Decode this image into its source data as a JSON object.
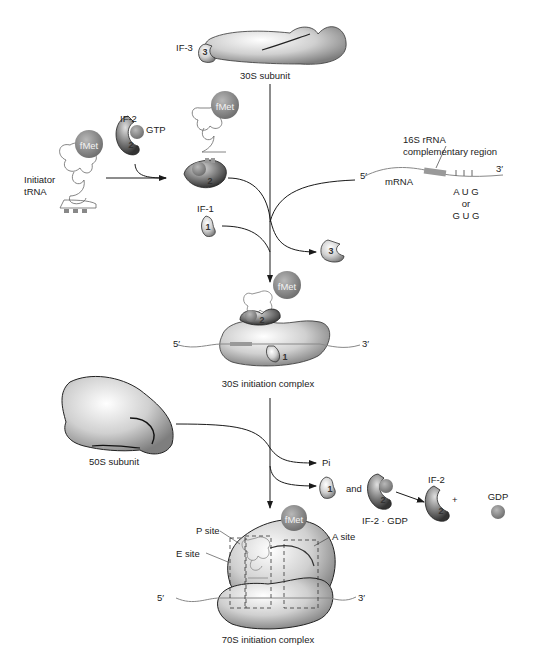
{
  "diagram": {
    "colors": {
      "ribosome_light": "#f2f2f2",
      "ribosome_dark": "#8a8a8a",
      "fmet_ball": "#8e8e8e",
      "line": "#1a1a1a",
      "mrna": "#777777",
      "complementary_region": "#9a9a9a"
    },
    "stage1": {
      "if3_label": "IF-3",
      "if3_number": "3",
      "subunit_label": "30S subunit"
    },
    "stage2": {
      "initiator_label_line1": "Initiator",
      "initiator_label_line2": "tRNA",
      "fmet_label": "fMet",
      "if2_label": "IF-2",
      "gtp_label": "GTP",
      "if2_number": "2",
      "if1_label": "IF-1",
      "if1_number": "1"
    },
    "mrna": {
      "five_prime": "5′",
      "three_prime": "3′",
      "label": "mRNA",
      "complementary_line1": "16S rRNA",
      "complementary_line2": "complementary region",
      "codon1": "A U G",
      "or": "or",
      "codon2": "G U G"
    },
    "released_if3": {
      "number": "3"
    },
    "complex30S": {
      "fmet_label": "fMet",
      "five_prime": "5′",
      "three_prime": "3′",
      "if2_number": "2",
      "if1_number": "1",
      "label": "30S initiation complex"
    },
    "subunit50S": {
      "label": "50S subunit"
    },
    "products": {
      "pi_label": "Pi",
      "if1_number": "1",
      "and_label": "and",
      "if2gdp_number": "2",
      "if2gdp_label": "IF-2 · GDP",
      "if2_label": "IF-2",
      "if2_number": "2",
      "plus": "+",
      "gdp_label": "GDP"
    },
    "complex70S": {
      "fmet_label": "fMet",
      "p_site": "P site",
      "e_site": "E site",
      "a_site": "A site",
      "five_prime": "5′",
      "three_prime": "3′",
      "label": "70S initiation complex"
    }
  }
}
